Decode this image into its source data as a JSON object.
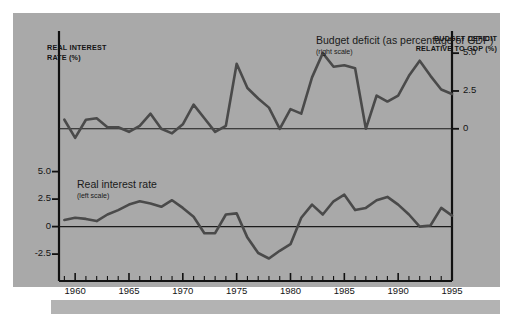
{
  "figure": {
    "background_color": "#a9a9a9",
    "page_color": "#ffffff",
    "line_color": "#4a4a4a",
    "axis_color": "#111111",
    "left_axis_title": "REAL INTEREST\nRATE (%)",
    "right_axis_title": "BUDGET DEFICIT\nRELATIVE TO GDP (%)"
  },
  "annotations": {
    "deficit": {
      "label": "Budget deficit\n(as percentage\nof GDP)",
      "scale_note": "(right scale)"
    },
    "rate": {
      "label": "Real interest rate",
      "scale_note": "(left scale)"
    }
  },
  "axes": {
    "x_ticks": [
      "1960",
      "1965",
      "1970",
      "1975",
      "1980",
      "1985",
      "1990",
      "1995"
    ],
    "x_tick_values": [
      1960,
      1965,
      1970,
      1975,
      1980,
      1985,
      1990,
      1995
    ],
    "x_minor_step": 1,
    "x_range": [
      1958.5,
      1995
    ],
    "y_left_ticks": [
      "5.0",
      "2.5",
      "0",
      "-2.5"
    ],
    "y_left_values": [
      5.0,
      2.5,
      0,
      -2.5
    ],
    "y_right_ticks": [
      "5.0",
      "2.5",
      "0",
      "-2.5"
    ],
    "y_right_values": [
      5.0,
      2.5,
      0,
      -2.5
    ]
  },
  "chart_data": {
    "type": "line",
    "title": "",
    "subtitle": "",
    "xlabel": "",
    "ylabel": "REAL INTEREST RATE (%)",
    "ylabel_right": "BUDGET DEFICIT RELATIVE TO GDP (%)",
    "grid": false,
    "legend": "inline-annotation",
    "xlim": [
      1958.5,
      1995
    ],
    "x": [
      1959,
      1960,
      1961,
      1962,
      1963,
      1964,
      1965,
      1966,
      1967,
      1968,
      1969,
      1970,
      1971,
      1972,
      1973,
      1974,
      1975,
      1976,
      1977,
      1978,
      1979,
      1980,
      1981,
      1982,
      1983,
      1984,
      1985,
      1986,
      1987,
      1988,
      1989,
      1990,
      1991,
      1992,
      1993,
      1994,
      1995
    ],
    "series": [
      {
        "name": "Budget deficit (as percentage of GDP)",
        "scale": "right",
        "ylim": [
          -1.6,
          6.2
        ],
        "color": "#4a4a4a",
        "values": [
          0.6,
          -0.6,
          0.6,
          0.7,
          0.1,
          0.1,
          -0.2,
          0.2,
          1.0,
          0.0,
          -0.3,
          0.3,
          1.6,
          0.7,
          -0.2,
          0.2,
          4.3,
          2.7,
          2.0,
          1.4,
          0.0,
          1.3,
          1.0,
          3.4,
          5.0,
          4.1,
          4.2,
          4.0,
          0.0,
          2.2,
          1.8,
          2.2,
          3.5,
          4.5,
          3.5,
          2.6,
          2.3
        ]
      },
      {
        "name": "Real interest rate",
        "scale": "left",
        "ylim": [
          -4.4,
          5.6
        ],
        "color": "#4a4a4a",
        "values": [
          0.6,
          0.8,
          0.7,
          0.5,
          1.1,
          1.5,
          2.0,
          2.3,
          2.1,
          1.8,
          2.4,
          1.7,
          0.9,
          -0.6,
          -0.6,
          1.1,
          1.2,
          -1.0,
          -2.4,
          -2.9,
          -2.2,
          -1.6,
          0.8,
          2.0,
          1.1,
          2.3,
          2.9,
          1.5,
          1.7,
          2.4,
          2.7,
          2.0,
          1.1,
          0.0,
          0.1,
          1.7,
          1.0
        ]
      }
    ]
  }
}
